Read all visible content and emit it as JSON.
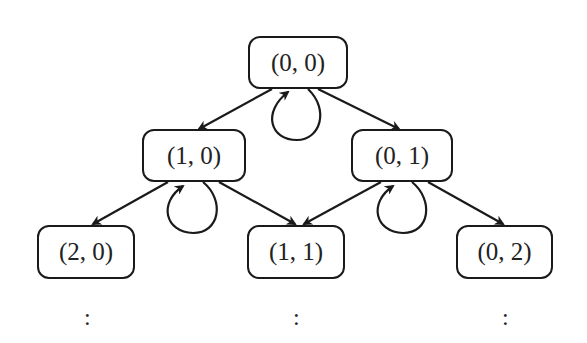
{
  "diagram": {
    "type": "state-transition-lattice",
    "nodes": [
      {
        "id": "n00",
        "label": "(0, 0)",
        "x": 248,
        "y": 36,
        "w": 100,
        "h": 53
      },
      {
        "id": "n10",
        "label": "(1, 0)",
        "x": 142,
        "y": 129,
        "w": 104,
        "h": 53
      },
      {
        "id": "n01",
        "label": "(0, 1)",
        "x": 351,
        "y": 129,
        "w": 102,
        "h": 53
      },
      {
        "id": "n20",
        "label": "(2, 0)",
        "x": 37,
        "y": 225,
        "w": 98,
        "h": 54
      },
      {
        "id": "n11",
        "label": "(1, 1)",
        "x": 247,
        "y": 225,
        "w": 98,
        "h": 54
      },
      {
        "id": "n02",
        "label": "(0, 2)",
        "x": 456,
        "y": 225,
        "w": 97,
        "h": 54
      }
    ],
    "edges": [
      {
        "from": "n00",
        "to": "n10"
      },
      {
        "from": "n00",
        "to": "n01"
      },
      {
        "from": "n00",
        "to": "n00",
        "type": "self-loop"
      },
      {
        "from": "n10",
        "to": "n20"
      },
      {
        "from": "n10",
        "to": "n11"
      },
      {
        "from": "n10",
        "to": "n10",
        "type": "self-loop"
      },
      {
        "from": "n01",
        "to": "n11"
      },
      {
        "from": "n01",
        "to": "n02"
      },
      {
        "from": "n01",
        "to": "n01",
        "type": "self-loop"
      }
    ],
    "continuation": [
      ":",
      ":",
      ":"
    ],
    "colors": {
      "stroke": "#1a1a1a",
      "text": "#222222",
      "background": "#ffffff"
    }
  }
}
